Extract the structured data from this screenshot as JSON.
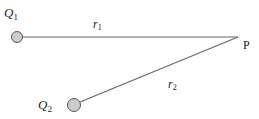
{
  "diagram": {
    "charges": [
      {
        "name": "Q",
        "sub": "1",
        "cx": 17,
        "cy": 37,
        "r": 5.5
      },
      {
        "name": "Q",
        "sub": "2",
        "cx": 74,
        "cy": 105,
        "r": 6.5
      }
    ],
    "point": {
      "label": "P",
      "x": 238,
      "y": 37
    },
    "distances": [
      {
        "name": "r",
        "sub": "1"
      },
      {
        "name": "r",
        "sub": "2"
      }
    ],
    "colors": {
      "line": "#555555",
      "charge_fill": "#cccccc",
      "charge_stroke": "#555555"
    }
  }
}
